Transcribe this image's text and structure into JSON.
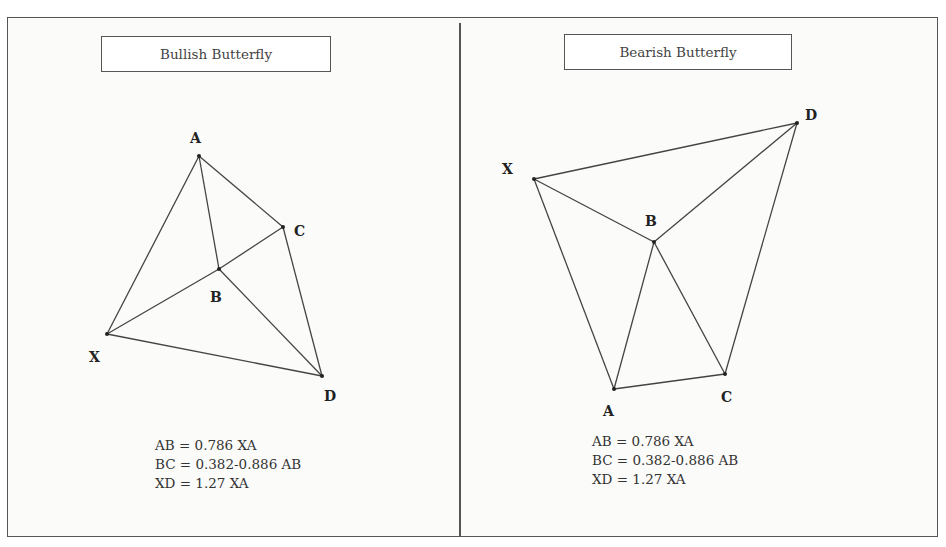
{
  "panels": [
    {
      "id": "bullish",
      "title": "Bullish Butterfly",
      "points": {
        "X": {
          "x": 107,
          "y": 334,
          "label_x": 89,
          "label_y": 362
        },
        "A": {
          "x": 199,
          "y": 156,
          "label_x": 190,
          "label_y": 143
        },
        "B": {
          "x": 219,
          "y": 269,
          "label_x": 210,
          "label_y": 302
        },
        "C": {
          "x": 283,
          "y": 227,
          "label_x": 294,
          "label_y": 236
        },
        "D": {
          "x": 322,
          "y": 376,
          "label_x": 324,
          "label_y": 401
        }
      },
      "segments": [
        [
          "X",
          "A"
        ],
        [
          "A",
          "B"
        ],
        [
          "A",
          "C"
        ],
        [
          "X",
          "B"
        ],
        [
          "B",
          "C"
        ],
        [
          "B",
          "D"
        ],
        [
          "C",
          "D"
        ],
        [
          "X",
          "D"
        ]
      ],
      "formulas": [
        "AB = 0.786 XA",
        "BC = 0.382-0.886 AB",
        "XD = 1.27 XA"
      ]
    },
    {
      "id": "bearish",
      "title": "Bearish Butterfly",
      "points": {
        "X": {
          "x": 534,
          "y": 179,
          "label_x": 502,
          "label_y": 174
        },
        "A": {
          "x": 614,
          "y": 389,
          "label_x": 603,
          "label_y": 416
        },
        "B": {
          "x": 654,
          "y": 242,
          "label_x": 645,
          "label_y": 226
        },
        "C": {
          "x": 725,
          "y": 374,
          "label_x": 721,
          "label_y": 402
        },
        "D": {
          "x": 797,
          "y": 123,
          "label_x": 805,
          "label_y": 120
        }
      },
      "segments": [
        [
          "X",
          "D"
        ],
        [
          "X",
          "A"
        ],
        [
          "X",
          "B"
        ],
        [
          "A",
          "B"
        ],
        [
          "A",
          "C"
        ],
        [
          "B",
          "C"
        ],
        [
          "C",
          "D"
        ],
        [
          "B",
          "D"
        ]
      ],
      "formulas": [
        "AB = 0.786 XA",
        "BC = 0.382-0.886 AB",
        "XD = 1.27 XA"
      ]
    }
  ]
}
